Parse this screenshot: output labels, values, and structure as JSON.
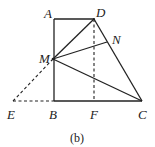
{
  "figure": {
    "caption": "(b)",
    "points": {
      "A": {
        "label": "A",
        "x": 54,
        "y": 19
      },
      "D": {
        "label": "D",
        "x": 94,
        "y": 19
      },
      "N": {
        "label": "N",
        "x": 107,
        "y": 42
      },
      "M": {
        "label": "M",
        "x": 53,
        "y": 59
      },
      "E": {
        "label": "E",
        "x": 13,
        "y": 101
      },
      "B": {
        "label": "B",
        "x": 54,
        "y": 101
      },
      "F": {
        "label": "F",
        "x": 94,
        "y": 101
      },
      "C": {
        "label": "C",
        "x": 142,
        "y": 101
      }
    },
    "solid_segments": [
      "AD",
      "AB",
      "BC",
      "DC",
      "MD",
      "MN",
      "MC"
    ],
    "dashed_segments": [
      "DF",
      "ME",
      "EB"
    ],
    "line_color": "#222222"
  }
}
